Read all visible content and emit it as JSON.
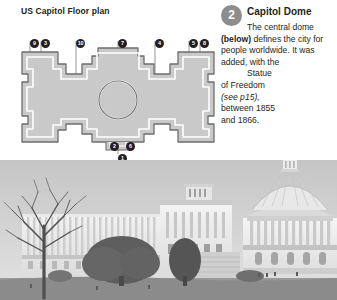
{
  "page": {
    "title": "US Capitol Floor plan",
    "background": "#ffffff",
    "ink": "#231f20"
  },
  "floor_plan": {
    "name": "us-capitol-floor-plan-diagram",
    "fill": "#c9c9c9",
    "outline": "#6e6e6e",
    "markers": [
      {
        "label": "9",
        "x": 30,
        "y": 39
      },
      {
        "label": "3",
        "x": 41,
        "y": 39
      },
      {
        "label": "10",
        "x": 76,
        "y": 39
      },
      {
        "label": "7",
        "x": 118,
        "y": 39
      },
      {
        "label": "4",
        "x": 155,
        "y": 39
      },
      {
        "label": "5",
        "x": 189,
        "y": 39
      },
      {
        "label": "8",
        "x": 200,
        "y": 39
      },
      {
        "label": "2",
        "x": 110,
        "y": 142
      },
      {
        "label": "6",
        "x": 126,
        "y": 142
      },
      {
        "label": "1",
        "x": 118,
        "y": 154
      }
    ]
  },
  "callout": {
    "badge": "2",
    "badge_color": "#8d8d8d",
    "heading": "Capitol Dome",
    "text_line_1": "The central dome",
    "text_bold": "(below)",
    "text_line_2": " defines the city",
    "text_line_3": "for people worldwide.",
    "text_line_4": "It was added, with the",
    "text_line_5": "Statue of Freedom",
    "text_citation": "(see p15),",
    "text_line_6": "between 1855 and 1866."
  },
  "photo": {
    "name": "us-capitol-building-photograph",
    "caption": "",
    "sky": "#d6d6d6",
    "lawn": "#8f8f8f",
    "stone": "#efefef"
  }
}
